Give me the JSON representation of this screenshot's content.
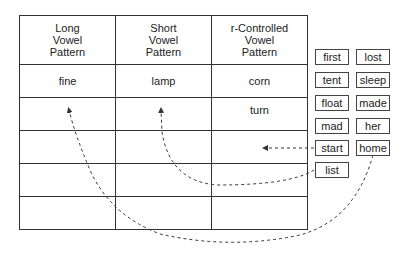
{
  "table": {
    "headers": [
      [
        "Long",
        "Vowel",
        "Pattern"
      ],
      [
        "Short",
        "Vowel",
        "Pattern"
      ],
      [
        "r-Controlled",
        "Vowel",
        "Pattern"
      ]
    ],
    "rows": [
      [
        "fine",
        "lamp",
        "corn"
      ],
      [
        "",
        "",
        "turn"
      ],
      [
        "",
        "",
        ""
      ],
      [
        "",
        "",
        ""
      ],
      [
        "",
        "",
        ""
      ]
    ]
  },
  "word_bank": {
    "words": [
      "first",
      "lost",
      "tent",
      "sleep",
      "float",
      "made",
      "mad",
      "her",
      "start",
      "home",
      "list"
    ]
  },
  "arrows": [
    {
      "from": "start",
      "to": "r-Controlled column, row 3"
    },
    {
      "from": "list",
      "to": "Short Vowel column, row 2"
    },
    {
      "from": "home",
      "to": "Long Vowel column, row 2"
    }
  ],
  "colors": {
    "line": "#333333",
    "text": "#222222",
    "background": "#ffffff"
  }
}
